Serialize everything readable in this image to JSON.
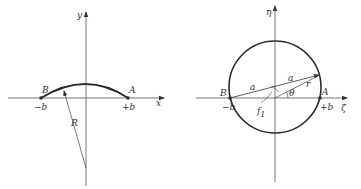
{
  "left_figure": {
    "axis_x_label": "x",
    "axis_y_label": "y",
    "point_B_label": "B",
    "point_A_label": "A",
    "tick_minus_b": "−b",
    "tick_plus_b": "+b",
    "radius_label": "R"
  },
  "right_figure": {
    "axis_zeta_label": "ζ",
    "axis_eta_label": "η",
    "point_B_label": "B",
    "point_A_label": "A",
    "tick_minus_b": "−b",
    "tick_plus_b": "+b",
    "segment_a_left": "a",
    "segment_a_right": "a",
    "radius_label": "r",
    "angle_label": "θ",
    "focus_label": "f",
    "focus_subscript": "1"
  },
  "colors": {
    "stroke": "#2a2a2a",
    "axis": "#555555",
    "background": "#ffffff"
  }
}
